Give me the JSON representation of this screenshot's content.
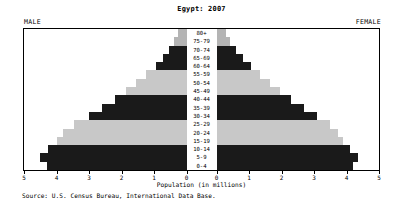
{
  "chart_data": {
    "type": "bar",
    "subtype": "population-pyramid",
    "title": "Egypt: 2007",
    "xlabel": "Population (in millions)",
    "ylabel": "",
    "source": "Source: U.S. Census Bureau, International Data Base.",
    "left_header": "MALE",
    "right_header": "FEMALE",
    "grid": false,
    "legend": "none",
    "xlim_left": [
      5,
      0
    ],
    "xlim_right": [
      0,
      5
    ],
    "xticks_left": [
      "5",
      "4",
      "3",
      "2",
      "1",
      "0"
    ],
    "xticks_right": [
      "0",
      "1",
      "2",
      "3",
      "4",
      "5"
    ],
    "categories": [
      "80+",
      "75-79",
      "70-74",
      "65-69",
      "60-64",
      "55-59",
      "50-54",
      "45-49",
      "40-44",
      "35-39",
      "30-34",
      "25-29",
      "20-24",
      "15-19",
      "10-14",
      "5-9",
      "0-4"
    ],
    "series": [
      {
        "name": "MALE",
        "side": "left",
        "values": [
          0.25,
          0.38,
          0.55,
          0.73,
          0.95,
          1.25,
          1.55,
          1.85,
          2.2,
          2.6,
          3.0,
          3.45,
          3.8,
          4.0,
          4.25,
          4.5,
          4.3
        ]
      },
      {
        "name": "FEMALE",
        "side": "right",
        "values": [
          0.28,
          0.42,
          0.6,
          0.8,
          1.05,
          1.35,
          1.65,
          1.95,
          2.3,
          2.7,
          3.1,
          3.5,
          3.75,
          3.9,
          4.1,
          4.35,
          4.2
        ]
      }
    ],
    "bar_colors": [
      "#b4b4b4",
      "#b4b4b4",
      "#1a1a1a",
      "#1a1a1a",
      "#1a1a1a",
      "#c8c8c8",
      "#c8c8c8",
      "#c8c8c8",
      "#1a1a1a",
      "#1a1a1a",
      "#1a1a1a",
      "#c8c8c8",
      "#c8c8c8",
      "#c8c8c8",
      "#1a1a1a",
      "#1a1a1a",
      "#1a1a1a"
    ],
    "frame_color": "#000000",
    "background": "#ffffff"
  }
}
